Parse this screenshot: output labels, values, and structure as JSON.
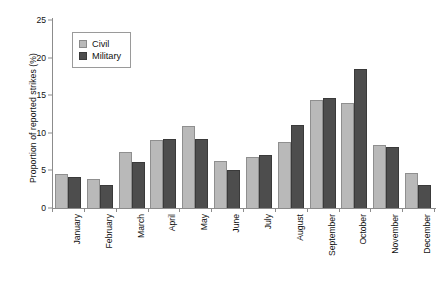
{
  "chart_data": {
    "type": "bar",
    "title": "",
    "xlabel": "",
    "ylabel": "Proportion of reported strikes (%)",
    "ylim": [
      0,
      25
    ],
    "yticks": [
      0,
      5,
      10,
      15,
      20,
      25
    ],
    "grid": false,
    "legend_position": "top-left",
    "categories": [
      "January",
      "February",
      "March",
      "April",
      "May",
      "June",
      "July",
      "August",
      "September",
      "October",
      "November",
      "December"
    ],
    "series": [
      {
        "name": "Civil",
        "color": "#b9b9b9",
        "values": [
          4.5,
          3.8,
          7.5,
          9.0,
          10.9,
          6.3,
          6.8,
          8.8,
          14.4,
          13.9,
          8.4,
          4.7
        ]
      },
      {
        "name": "Military",
        "color": "#4d4d4d",
        "values": [
          4.1,
          3.1,
          6.1,
          9.2,
          9.2,
          5.0,
          7.0,
          11.0,
          14.6,
          18.5,
          8.1,
          3.0
        ]
      }
    ]
  },
  "legend": {
    "items": [
      {
        "label": "Civil"
      },
      {
        "label": "Military"
      }
    ]
  }
}
